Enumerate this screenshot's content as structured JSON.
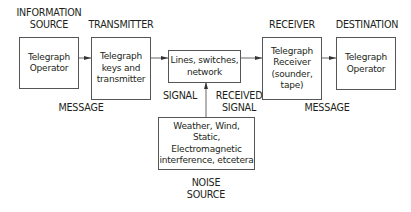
{
  "diagram": {
    "type": "communication-model",
    "nodes": [
      {
        "id": "info-source",
        "heading": "INFORMATION\nSOURCE",
        "text": "Telegraph\nOperator"
      },
      {
        "id": "transmitter",
        "heading": "TRANSMITTER",
        "text": "Telegraph\nkeys and\ntransmitter"
      },
      {
        "id": "channel",
        "heading": "",
        "text": "Lines, switches,\nnetwork"
      },
      {
        "id": "receiver",
        "heading": "RECEIVER",
        "text": "Telegraph\nReceiver\n(sounder,\ntape)"
      },
      {
        "id": "destination",
        "heading": "DESTINATION",
        "text": "Telegraph\nOperator"
      },
      {
        "id": "noise",
        "heading": "NOISE\nSOURCE",
        "text": "Weather, Wind, Static,\nElectromagnetic\ninterference, etcetera"
      }
    ],
    "edge_labels": {
      "message_left": "MESSAGE",
      "signal": "SIGNAL",
      "received_signal": "RECEIVED\nSIGNAL",
      "message_right": "MESSAGE"
    },
    "edges": [
      {
        "from": "info-source",
        "to": "transmitter"
      },
      {
        "from": "transmitter",
        "to": "channel"
      },
      {
        "from": "channel",
        "to": "receiver"
      },
      {
        "from": "receiver",
        "to": "destination"
      },
      {
        "from": "noise",
        "to": "channel"
      }
    ]
  }
}
